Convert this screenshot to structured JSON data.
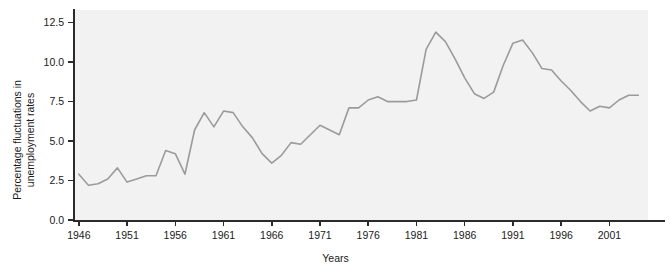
{
  "chart_data": {
    "type": "line",
    "title": "",
    "xlabel": "Years",
    "ylabel": "Percentage fluctuations in\nunemployment rates",
    "ylabel_line1": "Percentage fluctuations in",
    "ylabel_line2": "unemployment rates",
    "xlim": [
      1945.5,
      2005.0
    ],
    "ylim": [
      0.0,
      13.3
    ],
    "grid": false,
    "legend": null,
    "line_color": "#9b9b9b",
    "plot_background": "#f2f2f2",
    "axis_color": "#2b2b2b",
    "yticks": [
      0.0,
      2.5,
      5.0,
      7.5,
      10.0,
      12.5
    ],
    "ytick_labels": [
      "0.0",
      "2.5",
      "5.0",
      "7.5",
      "10.0",
      "12.5"
    ],
    "xticks": [
      1946,
      1951,
      1956,
      1961,
      1966,
      1971,
      1976,
      1981,
      1986,
      1991,
      1996,
      2001
    ],
    "xtick_labels": [
      "1946",
      "1951",
      "1956",
      "1961",
      "1966",
      "1971",
      "1976",
      "1981",
      "1986",
      "1991",
      "1996",
      "2001"
    ],
    "x": [
      1946,
      1947,
      1948,
      1949,
      1950,
      1951,
      1952,
      1953,
      1954,
      1955,
      1956,
      1957,
      1958,
      1959,
      1960,
      1961,
      1962,
      1963,
      1964,
      1965,
      1966,
      1967,
      1968,
      1969,
      1970,
      1971,
      1972,
      1973,
      1974,
      1975,
      1976,
      1977,
      1978,
      1979,
      1980,
      1981,
      1982,
      1983,
      1984,
      1985,
      1986,
      1987,
      1988,
      1989,
      1990,
      1991,
      1992,
      1993,
      1994,
      1995,
      1996,
      1997,
      1998,
      1999,
      2000,
      2001,
      2002,
      2003,
      2004
    ],
    "values": [
      2.9,
      2.2,
      2.3,
      2.6,
      3.3,
      2.4,
      2.6,
      2.8,
      2.8,
      4.4,
      4.2,
      2.9,
      5.7,
      6.8,
      5.9,
      6.9,
      6.8,
      5.9,
      5.2,
      4.2,
      3.6,
      4.1,
      4.9,
      4.8,
      5.4,
      6.0,
      5.7,
      5.4,
      7.1,
      7.1,
      7.6,
      7.8,
      7.5,
      7.5,
      7.5,
      7.6,
      10.8,
      11.9,
      11.3,
      10.2,
      9.0,
      8.0,
      7.7,
      8.1,
      9.8,
      11.2,
      11.4,
      10.6,
      9.6,
      9.5,
      8.8,
      8.2,
      7.5,
      6.9,
      7.2,
      7.1,
      7.6,
      7.9,
      7.9
    ],
    "series": [
      {
        "name": "Percentage fluctuations in unemployment rates",
        "color": "#9b9b9b",
        "values": [
          2.9,
          2.2,
          2.3,
          2.6,
          3.3,
          2.4,
          2.6,
          2.8,
          2.8,
          4.4,
          4.2,
          2.9,
          5.7,
          6.8,
          5.9,
          6.9,
          6.8,
          5.9,
          5.2,
          4.2,
          3.6,
          4.1,
          4.9,
          4.8,
          5.4,
          6.0,
          5.7,
          5.4,
          7.1,
          7.1,
          7.6,
          7.8,
          7.5,
          7.5,
          7.5,
          7.6,
          10.8,
          11.9,
          11.3,
          10.2,
          9.0,
          8.0,
          7.7,
          8.1,
          9.8,
          11.2,
          11.4,
          10.6,
          9.6,
          9.5,
          8.8,
          8.2,
          7.5,
          6.9,
          7.2,
          7.1,
          7.6,
          7.9,
          7.9
        ]
      }
    ]
  }
}
